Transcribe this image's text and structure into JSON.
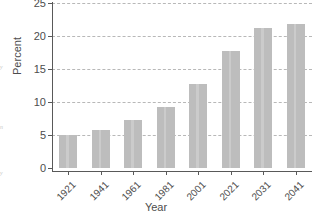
{
  "chart_data": {
    "type": "bar",
    "title": "",
    "xlabel": "Year",
    "ylabel": "Percent",
    "categories": [
      "1921",
      "1941",
      "1961",
      "1981",
      "2001",
      "2021",
      "2031",
      "2041"
    ],
    "values": [
      5.0,
      5.7,
      7.2,
      9.3,
      12.7,
      17.8,
      21.2,
      21.8
    ],
    "ylim": [
      0,
      25
    ],
    "yticks": [
      0,
      5,
      10,
      15,
      20,
      25
    ],
    "ytick_labels": [
      "0",
      "5",
      "10",
      "15",
      "20",
      "25"
    ],
    "grid": "horizontal-dashed",
    "legend": "none",
    "bar_color": "#bdbdbd",
    "axis_color": "#595959",
    "grid_color": "#b8b8b8",
    "text_color": "#4d4d4d"
  },
  "margin_fragments": {
    "frag_a": "y",
    "frag_b": "n",
    "frag_c": "y"
  }
}
